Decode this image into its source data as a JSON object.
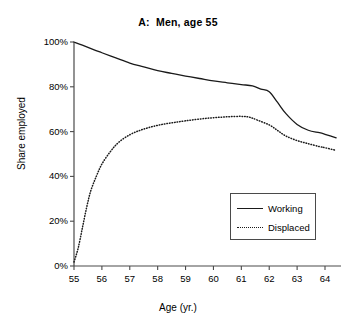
{
  "chart_data": {
    "type": "line",
    "title": "A:  Men, age 55",
    "xlabel": "Age (yr.)",
    "ylabel": "Share employed",
    "xlim": [
      55,
      64.7
    ],
    "ylim": [
      0,
      100
    ],
    "grid": false,
    "legend_position": "inside-lower-right",
    "xticks": [
      55,
      56,
      57,
      58,
      59,
      60,
      61,
      62,
      63,
      64
    ],
    "xtick_labels": [
      "55",
      "56",
      "57",
      "58",
      "59",
      "60",
      "61",
      "62",
      "63",
      "64"
    ],
    "yticks": [
      0,
      20,
      40,
      60,
      80,
      100
    ],
    "ytick_labels": [
      "0%",
      "20%",
      "40%",
      "60%",
      "80%",
      "100%"
    ],
    "series": [
      {
        "name": "Working",
        "style": "solid",
        "color": "#1a1a1a",
        "x": [
          55.0,
          55.3,
          55.7,
          56.0,
          56.5,
          57.0,
          57.5,
          58.0,
          58.5,
          59.0,
          59.5,
          60.0,
          60.5,
          61.0,
          61.4,
          61.7,
          62.0,
          62.3,
          62.6,
          63.0,
          63.4,
          63.8,
          64.0,
          64.4
        ],
        "y": [
          100.0,
          98.6,
          96.6,
          95.2,
          92.9,
          90.6,
          88.9,
          87.2,
          86.0,
          84.8,
          83.7,
          82.6,
          81.8,
          81.0,
          80.4,
          79.0,
          77.8,
          73.0,
          68.0,
          63.2,
          60.6,
          59.5,
          58.8,
          57.2
        ]
      },
      {
        "name": "Displaced",
        "style": "dotted",
        "color": "#1a1a1a",
        "x": [
          55.0,
          55.15,
          55.3,
          55.45,
          55.6,
          55.8,
          56.0,
          56.3,
          56.6,
          57.0,
          57.4,
          57.8,
          58.2,
          58.6,
          59.0,
          59.5,
          60.0,
          60.5,
          61.0,
          61.3,
          61.6,
          62.0,
          62.3,
          62.6,
          63.0,
          63.4,
          63.8,
          64.0,
          64.4
        ],
        "y": [
          1.8,
          8.0,
          17.0,
          26.0,
          33.5,
          40.0,
          45.5,
          51.0,
          55.2,
          58.6,
          60.7,
          62.2,
          63.3,
          64.1,
          64.8,
          65.6,
          66.2,
          66.6,
          66.8,
          66.4,
          65.0,
          63.0,
          60.5,
          58.0,
          56.0,
          54.6,
          53.3,
          52.8,
          51.6
        ]
      }
    ]
  },
  "legend": {
    "items": [
      {
        "label": "Working",
        "style": "solid"
      },
      {
        "label": "Displaced",
        "style": "dotted"
      }
    ]
  },
  "top_crop": {
    "text": " "
  }
}
